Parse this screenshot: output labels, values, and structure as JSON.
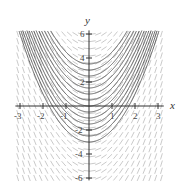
{
  "chart_data": {
    "type": "line",
    "subtype": "slope-field",
    "title": "",
    "xlabel": "x",
    "ylabel": "y",
    "xlim": [
      -3,
      3
    ],
    "ylim": [
      -6,
      6
    ],
    "x_ticks": [
      -3,
      -2,
      -1,
      1,
      2,
      3
    ],
    "x_tick_labels": [
      "-3",
      "-2",
      "-1",
      "1",
      "2",
      "3"
    ],
    "y_ticks": [
      -6,
      -4,
      -2,
      2,
      4,
      6
    ],
    "y_tick_labels": [
      "-6",
      "-4",
      "-2",
      "2",
      "4",
      "6"
    ],
    "grid": false,
    "legend": null,
    "slope_field": {
      "description": "short light-gray segments with slope 2x on a grid",
      "x_step": 0.25,
      "y_step": 0.6,
      "color": "#bdbdbd"
    },
    "series": [
      {
        "name": "y = x^2 + C",
        "C_values": [
          -3,
          -2.5,
          -2,
          -1.5,
          -1,
          -0.5,
          0,
          0.5,
          1,
          1.5,
          2,
          2.5,
          3,
          3.5
        ],
        "color": "#555555"
      }
    ]
  },
  "axes": {
    "x_label": "x",
    "y_label": "y",
    "color": "#333333"
  }
}
